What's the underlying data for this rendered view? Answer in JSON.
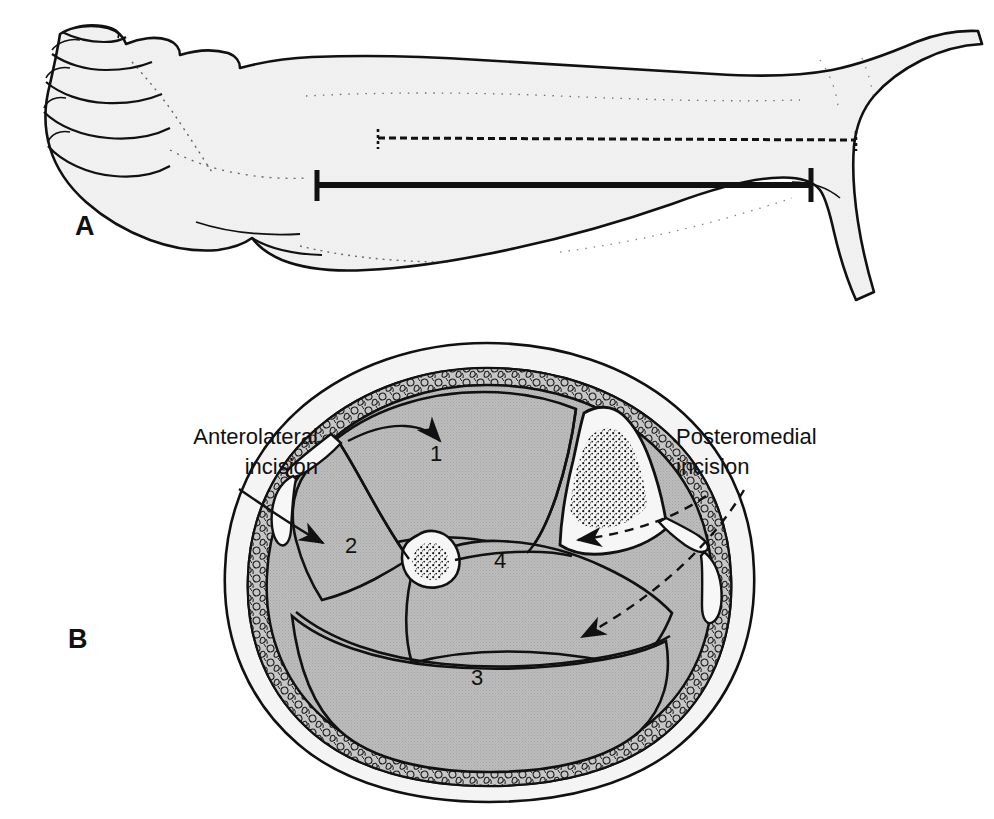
{
  "figure": {
    "type": "anatomical-illustration",
    "panels": [
      {
        "letter": "A",
        "name": "lateral-leg-view",
        "description": "Lateral view of lower leg and foot with incision line and extent bar"
      },
      {
        "letter": "B",
        "name": "leg-cross-section",
        "description": "Transverse cross section of leg showing four muscle compartments"
      }
    ]
  },
  "panel_a": {
    "letter": "A",
    "incision_line_style": "dashed",
    "extent_bar_style": "solid-with-end-caps"
  },
  "panel_b": {
    "letter": "B",
    "callouts": [
      {
        "id": "anterolateral",
        "line1": "Anterolateral",
        "line2": "incision",
        "align": "right",
        "leader_style": "solid",
        "targets": [
          "1",
          "2"
        ]
      },
      {
        "id": "posteromedial",
        "line1": "Posteromedial",
        "line2": "incision",
        "align": "left",
        "leader_style": "dashed",
        "targets": [
          "4",
          "3"
        ]
      }
    ],
    "compartments": [
      {
        "number": "1",
        "name": "anterior-compartment"
      },
      {
        "number": "2",
        "name": "lateral-compartment"
      },
      {
        "number": "3",
        "name": "superficial-posterior-compartment"
      },
      {
        "number": "4",
        "name": "deep-posterior-compartment"
      }
    ],
    "bones": [
      {
        "name": "tibia",
        "fill": "light"
      },
      {
        "name": "fibula",
        "fill": "light"
      }
    ]
  },
  "colors": {
    "background": "#ffffff",
    "ink": "#111111",
    "skin_fill": "#f2f2f2",
    "muscle_fill": "#b9b9b9",
    "fat_fill": "#c9c9c9",
    "bone_fill": "#f4f4f4",
    "leg_fill": "#f1f1f1"
  }
}
